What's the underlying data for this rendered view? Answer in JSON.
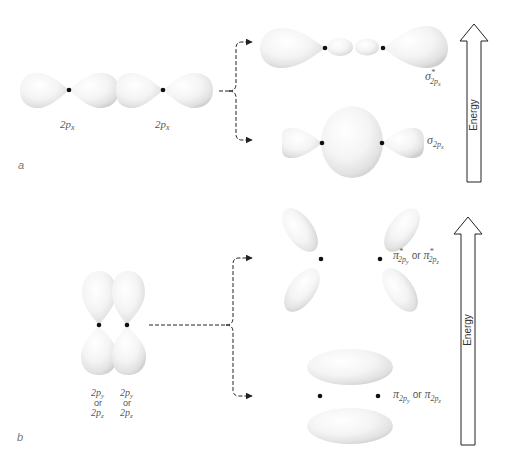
{
  "figure": {
    "panel_a": {
      "letter": "a",
      "atomic_orbitals": [
        {
          "label_main": "2p",
          "label_sub": "x"
        },
        {
          "label_main": "2p",
          "label_sub": "x"
        }
      ],
      "molecular_orbitals": {
        "antibonding": {
          "symbol": "σ",
          "superscript": "*",
          "subscript": "2p",
          "subsub": "x"
        },
        "bonding": {
          "symbol": "σ",
          "subscript": "2p",
          "subsub": "x"
        }
      },
      "energy_label": "Energy"
    },
    "panel_b": {
      "letter": "b",
      "atomic_orbitals": [
        {
          "line1_main": "2p",
          "line1_sub": "y",
          "line2": "or",
          "line3_main": "2p",
          "line3_sub": "z"
        },
        {
          "line1_main": "2p",
          "line1_sub": "y",
          "line2": "or",
          "line3_main": "2p",
          "line3_sub": "z"
        }
      ],
      "molecular_orbitals": {
        "antibonding": {
          "symbol": "π",
          "superscript": "*",
          "subscript": "2p",
          "subsub_a": "y",
          "connector": "or",
          "subsub_b": "z"
        },
        "bonding": {
          "symbol": "π",
          "subscript": "2p",
          "subsub_a": "y",
          "connector": "or",
          "subsub_b": "z"
        }
      },
      "energy_label": "Energy"
    },
    "colors": {
      "lobe_fill": "#f2f2f2",
      "lobe_shadow": "#d4d4d4",
      "nucleus": "#111111",
      "arrow": "#222222",
      "label": "#555555"
    }
  }
}
